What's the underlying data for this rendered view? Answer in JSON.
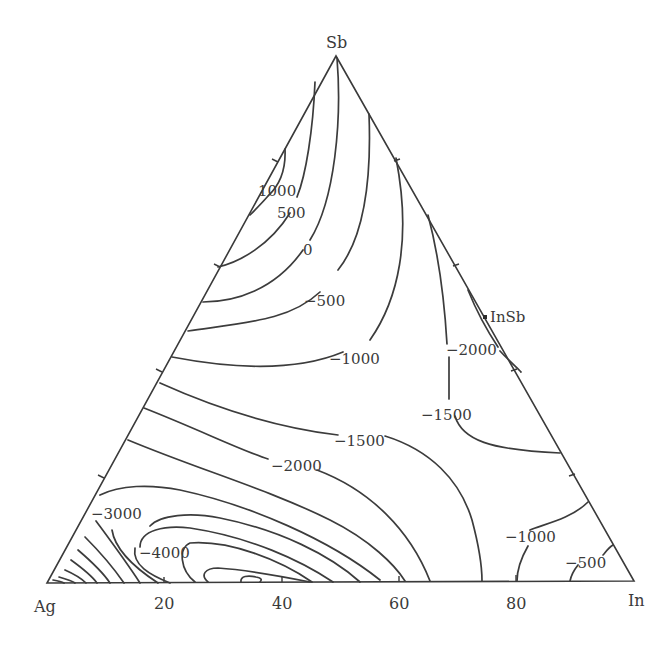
{
  "diagram": {
    "type": "ternary-isoline",
    "vertices": {
      "top": "Sb",
      "bottom_left": "Ag",
      "bottom_right": "In"
    },
    "bottom_axis_ticks": [
      "20",
      "40",
      "60",
      "80"
    ],
    "compound_marker": {
      "label": "InSb"
    },
    "contour_labels": [
      "1000",
      "500",
      "0",
      "−500",
      "−1000",
      "−1500",
      "−2000",
      "−3000",
      "−4000",
      "−2000",
      "−1500",
      "−1000",
      "−500"
    ],
    "contour_label_values": [
      1000,
      500,
      0,
      -500,
      -1000,
      -1500,
      -2000,
      -3000,
      -4000,
      -2000,
      -1500,
      -1000,
      -500
    ],
    "line_color": "#3c3c3c",
    "background_color": "#ffffff"
  }
}
